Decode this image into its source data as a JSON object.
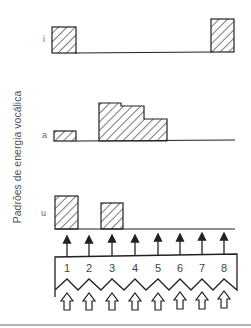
{
  "figure": {
    "y_axis_label": "Padrões de energia vocálica",
    "rows": [
      {
        "label": "i",
        "bars": [
          {
            "from": 1,
            "to": 1,
            "level": 0.85
          },
          {
            "from": 8,
            "to": 8,
            "level": 1.0
          }
        ]
      },
      {
        "label": "a",
        "bars": [
          {
            "from": 1,
            "to": 1,
            "level": 0.4
          },
          {
            "from": 3,
            "to": 3,
            "level": 1.0
          },
          {
            "from": 4,
            "to": 4,
            "level": 0.9
          },
          {
            "from": 5,
            "to": 5,
            "level": 0.6
          }
        ]
      },
      {
        "label": "u",
        "bars": [
          {
            "from": 1,
            "to": 1,
            "level": 1.0
          },
          {
            "from": 3,
            "to": 3,
            "level": 0.75
          }
        ]
      }
    ],
    "channels": [
      "1",
      "2",
      "3",
      "4",
      "5",
      "6",
      "7",
      "8"
    ],
    "colors": {
      "line": "#222222",
      "label": "#555555",
      "divider": "#999999"
    }
  }
}
